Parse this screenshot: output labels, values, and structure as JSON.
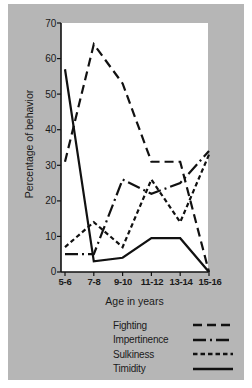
{
  "chart_data": {
    "type": "line",
    "title": "",
    "xlabel": "Age in years",
    "ylabel": "Percentage of behavior",
    "categories": [
      "5-6",
      "7-8",
      "9-10",
      "11-12",
      "13-14",
      "15-16"
    ],
    "ylim": [
      0,
      70
    ],
    "yticks": [
      0,
      10,
      20,
      30,
      40,
      50,
      60,
      70
    ],
    "grid": false,
    "legend_position": "below-right",
    "series": [
      {
        "name": "Fighting",
        "style": "long-dash",
        "values": [
          31,
          64,
          53,
          31,
          31,
          0
        ]
      },
      {
        "name": "Impertinence",
        "style": "dash-dot",
        "values": [
          5,
          5,
          26,
          22,
          25,
          34
        ]
      },
      {
        "name": "Sulkiness",
        "style": "short-dash",
        "values": [
          7,
          14,
          7,
          26,
          14,
          33
        ]
      },
      {
        "name": "Timidity",
        "style": "solid",
        "values": [
          57,
          3,
          4,
          9.5,
          9.5,
          0
        ]
      }
    ]
  },
  "legend": {
    "items": [
      {
        "label": "Fighting",
        "style": "long-dash"
      },
      {
        "label": "Impertinence",
        "style": "dash-dot"
      },
      {
        "label": "Sulkiness",
        "style": "short-dash"
      },
      {
        "label": "Timidity",
        "style": "solid"
      }
    ]
  },
  "colors": {
    "background": "#ffffff",
    "card": "#b6b6b6",
    "plot_area": "#ffffff",
    "ink": "#111111"
  }
}
